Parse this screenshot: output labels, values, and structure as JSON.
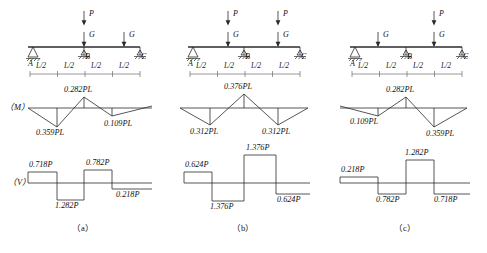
{
  "figure": {
    "panels": [
      {
        "caption": "（a）",
        "beam": {
          "nodes": [
            "A",
            "B",
            "C"
          ],
          "spans": [
            "L/2",
            "L/2",
            "L/2",
            "L/2"
          ],
          "supports": [
            "pin",
            "roller",
            "roller"
          ],
          "loads": [
            {
              "label_top": "P",
              "label_bottom": "G",
              "has_top": true
            },
            {
              "label_top": "",
              "label_bottom": "G",
              "has_top": false
            }
          ]
        },
        "moment": {
          "tag": "（M）",
          "labels": [
            {
              "text": "0.282PL",
              "side": "above"
            },
            {
              "text": "0.359PL",
              "side": "below"
            },
            {
              "text": "0.109PL",
              "side": "below"
            }
          ]
        },
        "shear": {
          "tag": "（V）",
          "labels": [
            {
              "text": "0.718P",
              "side": "above"
            },
            {
              "text": "0.782P",
              "side": "above"
            },
            {
              "text": "1.282P",
              "side": "below"
            },
            {
              "text": "0.218P",
              "side": "below"
            }
          ]
        }
      },
      {
        "caption": "（b）",
        "beam": {
          "nodes": [
            "A",
            "B",
            "C"
          ],
          "spans": [
            "L/2",
            "L/2",
            "L/2",
            "L/2"
          ],
          "supports": [
            "pin",
            "roller",
            "roller"
          ],
          "loads": [
            {
              "label_top": "P",
              "label_bottom": "G",
              "has_top": true
            },
            {
              "label_top": "P",
              "label_bottom": "G",
              "has_top": true
            }
          ]
        },
        "moment": {
          "tag": "",
          "labels": [
            {
              "text": "0.376PL",
              "side": "above"
            },
            {
              "text": "0.312PL",
              "side": "below"
            },
            {
              "text": "0.312PL",
              "side": "below"
            }
          ]
        },
        "shear": {
          "tag": "",
          "labels": [
            {
              "text": "0.624P",
              "side": "above"
            },
            {
              "text": "1.376P",
              "side": "above"
            },
            {
              "text": "1.376P",
              "side": "below"
            },
            {
              "text": "0.624P",
              "side": "below"
            }
          ]
        }
      },
      {
        "caption": "（c）",
        "beam": {
          "nodes": [
            "A",
            "B",
            "C"
          ],
          "spans": [
            "L/2",
            "L/2",
            "L/2",
            "L/2"
          ],
          "supports": [
            "pin",
            "roller",
            "roller"
          ],
          "loads": [
            {
              "label_top": "",
              "label_bottom": "G",
              "has_top": false
            },
            {
              "label_top": "P",
              "label_bottom": "G",
              "has_top": true
            }
          ]
        },
        "moment": {
          "tag": "",
          "labels": [
            {
              "text": "0.282PL",
              "side": "above"
            },
            {
              "text": "0.109PL",
              "side": "below"
            },
            {
              "text": "0.359PL",
              "side": "below"
            }
          ]
        },
        "shear": {
          "tag": "",
          "labels": [
            {
              "text": "1.282P",
              "side": "above"
            },
            {
              "text": "0.218P",
              "side": "above"
            },
            {
              "text": "0.782P",
              "side": "below"
            },
            {
              "text": "0.718P",
              "side": "below"
            }
          ]
        }
      }
    ]
  }
}
